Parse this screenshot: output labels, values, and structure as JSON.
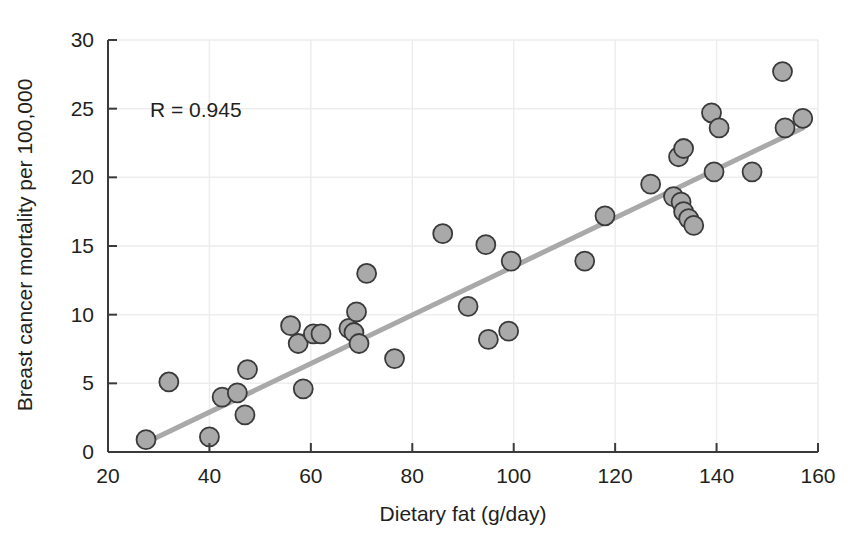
{
  "chart_data": {
    "type": "scatter",
    "title": "",
    "xlabel": "Dietary fat (g/day)",
    "ylabel": "Breast cancer mortality per 100,000",
    "xlim": [
      20,
      160
    ],
    "ylim": [
      0,
      30
    ],
    "xticks": [
      20,
      40,
      60,
      80,
      100,
      120,
      140,
      160
    ],
    "yticks": [
      0,
      5,
      10,
      15,
      20,
      25,
      30
    ],
    "grid": true,
    "legend": "none",
    "annotations": [
      {
        "text": "R = 0.945",
        "x": 40,
        "y": 25.0
      }
    ],
    "marker": {
      "shape": "circle",
      "fill": "#a9a9a9",
      "edge": "#3a3a3a",
      "size_px": 19
    },
    "trendline": {
      "type": "linear",
      "color": "#a9a9a9",
      "width_px": 5,
      "x": [
        27.0,
        157.0
      ],
      "y": [
        0.6,
        23.6
      ]
    },
    "points": [
      {
        "x": 27.5,
        "y": 0.9
      },
      {
        "x": 32.0,
        "y": 5.1
      },
      {
        "x": 40.0,
        "y": 1.1
      },
      {
        "x": 42.5,
        "y": 4.0
      },
      {
        "x": 45.5,
        "y": 4.3
      },
      {
        "x": 47.0,
        "y": 2.7
      },
      {
        "x": 47.5,
        "y": 6.0
      },
      {
        "x": 56.0,
        "y": 9.2
      },
      {
        "x": 57.5,
        "y": 7.9
      },
      {
        "x": 58.5,
        "y": 4.6
      },
      {
        "x": 60.5,
        "y": 8.6
      },
      {
        "x": 62.0,
        "y": 8.6
      },
      {
        "x": 67.5,
        "y": 9.0
      },
      {
        "x": 68.5,
        "y": 8.7
      },
      {
        "x": 69.0,
        "y": 10.2
      },
      {
        "x": 69.5,
        "y": 7.9
      },
      {
        "x": 71.0,
        "y": 13.0
      },
      {
        "x": 76.5,
        "y": 6.8
      },
      {
        "x": 86.0,
        "y": 15.9
      },
      {
        "x": 91.0,
        "y": 10.6
      },
      {
        "x": 94.5,
        "y": 15.1
      },
      {
        "x": 95.0,
        "y": 8.2
      },
      {
        "x": 99.0,
        "y": 8.8
      },
      {
        "x": 99.5,
        "y": 13.9
      },
      {
        "x": 114.0,
        "y": 13.9
      },
      {
        "x": 118.0,
        "y": 17.2
      },
      {
        "x": 127.0,
        "y": 19.5
      },
      {
        "x": 131.5,
        "y": 18.6
      },
      {
        "x": 132.5,
        "y": 21.5
      },
      {
        "x": 133.0,
        "y": 18.2
      },
      {
        "x": 133.5,
        "y": 22.1
      },
      {
        "x": 133.5,
        "y": 17.5
      },
      {
        "x": 134.5,
        "y": 17.0
      },
      {
        "x": 135.5,
        "y": 16.5
      },
      {
        "x": 139.0,
        "y": 24.7
      },
      {
        "x": 139.5,
        "y": 20.4
      },
      {
        "x": 140.5,
        "y": 23.6
      },
      {
        "x": 147.0,
        "y": 20.4
      },
      {
        "x": 153.0,
        "y": 27.7
      },
      {
        "x": 153.5,
        "y": 23.6
      },
      {
        "x": 157.0,
        "y": 24.3
      }
    ]
  },
  "axis": {
    "x_tick_labels": [
      "20",
      "40",
      "60",
      "80",
      "100",
      "120",
      "140",
      "160"
    ],
    "y_tick_labels": [
      "0",
      "5",
      "10",
      "15",
      "20",
      "25",
      "30"
    ],
    "x_title": "Dietary fat (g/day)",
    "y_title": "Breast cancer mortality per 100,000"
  },
  "annotation": {
    "correlation_label": "R = 0.945"
  },
  "colors": {
    "marker_fill": "#a9a9a9",
    "marker_edge": "#3a3a3a",
    "trendline": "#a9a9a9",
    "axis": "#3a3a3a",
    "grid": "#ededed",
    "text": "#231f20",
    "background": "#ffffff"
  }
}
